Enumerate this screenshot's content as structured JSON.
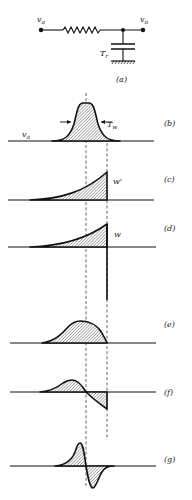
{
  "figure": {
    "circuit": {
      "input_label": "v",
      "input_sub": "a",
      "output_label": "v",
      "output_sub": "o",
      "capacitor_label": "T",
      "capacitor_sub": "r",
      "panel_label": "(a)"
    },
    "panels": [
      {
        "id": "b",
        "label": "(b)",
        "signal_label": "v",
        "signal_sub": "a",
        "annotation": "T",
        "annotation_sub": "w"
      },
      {
        "id": "c",
        "label": "(c)",
        "signal_label": "w'"
      },
      {
        "id": "d",
        "label": "(d)",
        "signal_label": "w"
      },
      {
        "id": "e",
        "label": "(e)"
      },
      {
        "id": "f",
        "label": "(f)"
      },
      {
        "id": "g",
        "label": "(g)"
      }
    ],
    "colors": {
      "ink": "#111111",
      "background": "#ffffff"
    }
  }
}
